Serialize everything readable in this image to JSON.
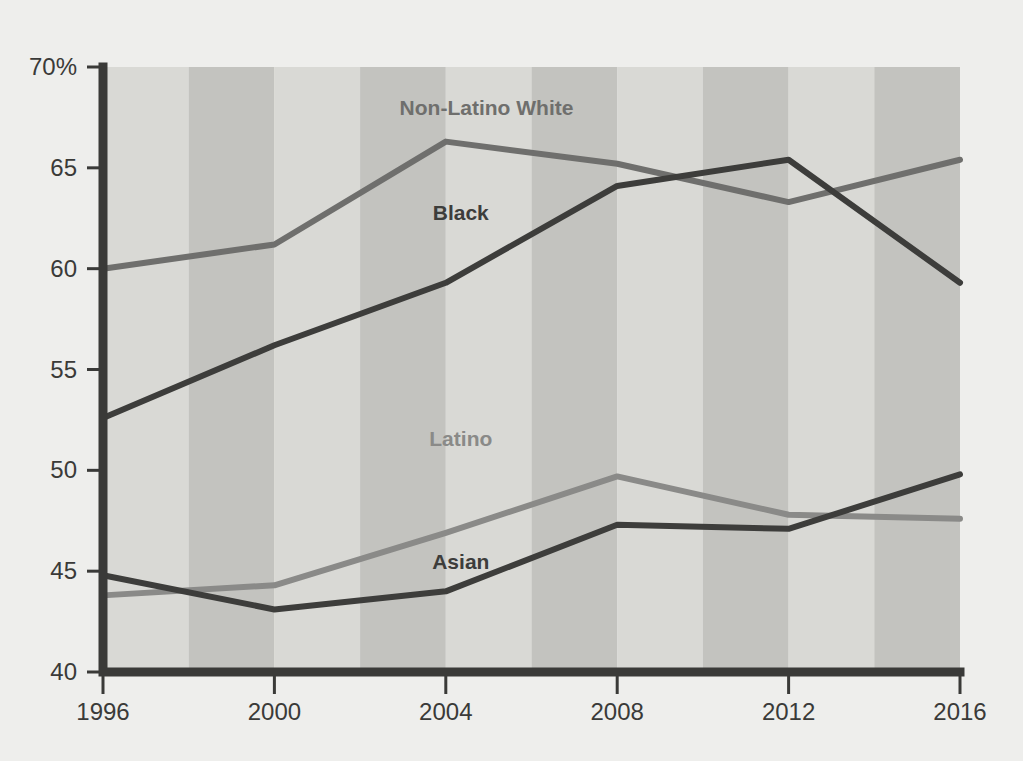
{
  "chart_data": {
    "type": "line",
    "title": "",
    "subtitle": "",
    "xlabel": "",
    "ylabel": "",
    "x": [
      1996,
      2000,
      2004,
      2008,
      2012,
      2016
    ],
    "categories": [
      "1996",
      "2000",
      "2004",
      "2008",
      "2012",
      "2016"
    ],
    "xlim": [
      1996,
      2016
    ],
    "ylim": [
      40,
      70
    ],
    "y_ticks": [
      40,
      45,
      50,
      55,
      60,
      65,
      70
    ],
    "y_tick_labels": [
      "40",
      "45",
      "50",
      "55",
      "60",
      "65",
      "70%"
    ],
    "x_ticks": [
      1996,
      2000,
      2004,
      2008,
      2012,
      2016
    ],
    "x_tick_labels": [
      "1996",
      "2000",
      "2004",
      "2008",
      "2012",
      "2016"
    ],
    "grid": false,
    "legend": "inline-labels",
    "background_bands": true,
    "series": [
      {
        "name": "Non-Latino White",
        "color": "#6f6f6d",
        "values": [
          60.0,
          61.2,
          66.3,
          65.2,
          63.3,
          65.4
        ],
        "label_x": 2004.95,
        "label_y": 67.6
      },
      {
        "name": "Black",
        "color": "#3d3d3b",
        "values": [
          52.6,
          56.2,
          59.3,
          64.1,
          65.4,
          59.3
        ],
        "label_x": 2004.35,
        "label_y": 62.4
      },
      {
        "name": "Latino",
        "color": "#8a8a88",
        "values": [
          43.8,
          44.3,
          46.9,
          49.7,
          47.8,
          47.6
        ],
        "label_x": 2004.35,
        "label_y": 51.2
      },
      {
        "name": "Asian",
        "color": "#3d3d3b",
        "values": [
          44.8,
          43.1,
          44.0,
          47.3,
          47.1,
          49.8
        ],
        "label_x": 2004.35,
        "label_y": 45.1
      }
    ]
  },
  "colors": {
    "page_background": "#eeeeec",
    "plot_band_light": "#d9d9d5",
    "plot_band_dark": "#c3c3bf",
    "axis": "#3a3a38",
    "tick_label": "#3a3a38"
  }
}
